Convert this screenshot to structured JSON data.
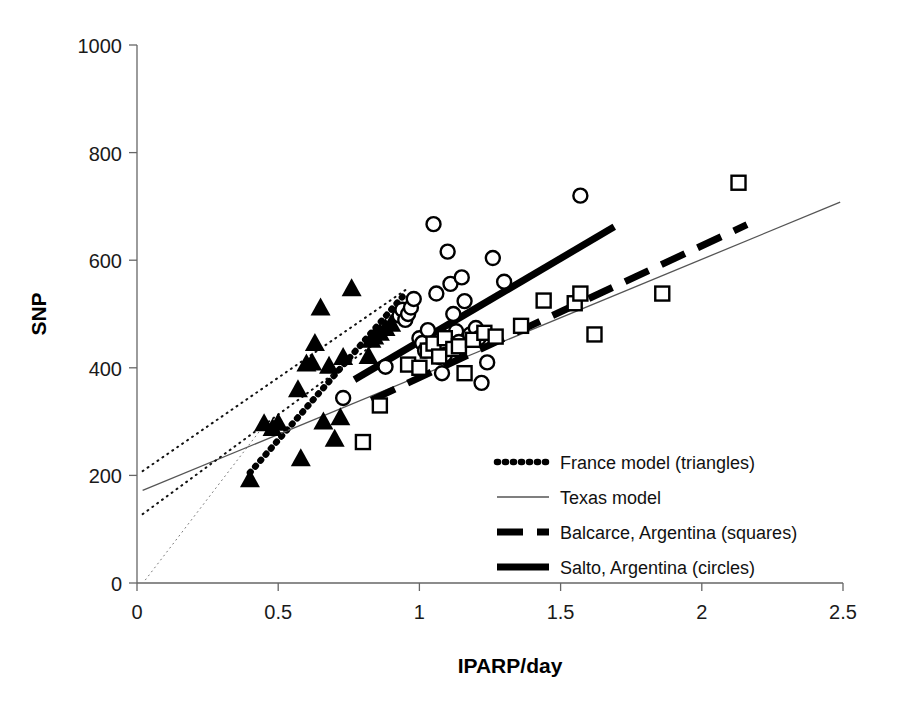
{
  "chart_data": {
    "type": "scatter",
    "title": "",
    "xlabel": "IPARP/day",
    "ylabel": "SNP",
    "xlim": [
      0,
      2.5
    ],
    "ylim": [
      0,
      1000
    ],
    "xticks": [
      "0",
      "0.5",
      "1",
      "1.5",
      "2",
      "2.5"
    ],
    "xtick_values": [
      0,
      0.5,
      1,
      1.5,
      2,
      2.5
    ],
    "yticks": [
      "0",
      "200",
      "400",
      "600",
      "800",
      "1000"
    ],
    "ytick_values": [
      0,
      200,
      400,
      600,
      800,
      1000
    ],
    "grid": false,
    "legend_position": "lower-right-inside",
    "legend": [
      {
        "label": "France model (triangles)",
        "style": "thick-dotted",
        "marker": "filled-triangle"
      },
      {
        "label": "Texas model",
        "style": "thin-solid",
        "marker": "none"
      },
      {
        "label": "Balcarce, Argentina (squares)",
        "style": "thick-dashed",
        "marker": "open-square"
      },
      {
        "label": "Salto, Argentina (circles)",
        "style": "thick-solid",
        "marker": "open-circle"
      }
    ],
    "series": [
      {
        "name": "France model (triangles)",
        "marker": "filled-triangle",
        "points": [
          [
            0.4,
            193
          ],
          [
            0.45,
            297
          ],
          [
            0.48,
            288
          ],
          [
            0.5,
            298
          ],
          [
            0.57,
            360
          ],
          [
            0.58,
            232
          ],
          [
            0.6,
            408
          ],
          [
            0.62,
            410
          ],
          [
            0.63,
            446
          ],
          [
            0.65,
            512
          ],
          [
            0.66,
            300
          ],
          [
            0.68,
            404
          ],
          [
            0.7,
            268
          ],
          [
            0.72,
            308
          ],
          [
            0.73,
            420
          ],
          [
            0.76,
            548
          ],
          [
            0.82,
            422
          ],
          [
            0.83,
            452
          ],
          [
            0.84,
            458
          ],
          [
            0.86,
            465
          ],
          [
            0.88,
            474
          ],
          [
            0.9,
            482
          ]
        ]
      },
      {
        "name": "Salto, Argentina (circles)",
        "marker": "open-circle",
        "points": [
          [
            0.73,
            344
          ],
          [
            0.88,
            402
          ],
          [
            0.93,
            497
          ],
          [
            0.94,
            508
          ],
          [
            0.95,
            489
          ],
          [
            0.96,
            500
          ],
          [
            0.97,
            512
          ],
          [
            0.98,
            528
          ],
          [
            1.0,
            455
          ],
          [
            1.01,
            446
          ],
          [
            1.02,
            432
          ],
          [
            1.03,
            470
          ],
          [
            1.05,
            667
          ],
          [
            1.06,
            538
          ],
          [
            1.07,
            420
          ],
          [
            1.08,
            390
          ],
          [
            1.09,
            424
          ],
          [
            1.1,
            616
          ],
          [
            1.11,
            556
          ],
          [
            1.12,
            500
          ],
          [
            1.13,
            468
          ],
          [
            1.14,
            448
          ],
          [
            1.15,
            568
          ],
          [
            1.16,
            524
          ],
          [
            1.18,
            462
          ],
          [
            1.2,
            474
          ],
          [
            1.21,
            455
          ],
          [
            1.22,
            372
          ],
          [
            1.24,
            410
          ],
          [
            1.26,
            604
          ],
          [
            1.3,
            560
          ],
          [
            1.57,
            720
          ]
        ]
      },
      {
        "name": "Balcarce, Argentina (squares)",
        "marker": "open-square",
        "points": [
          [
            0.8,
            262
          ],
          [
            0.86,
            330
          ],
          [
            0.96,
            406
          ],
          [
            1.0,
            400
          ],
          [
            1.03,
            432
          ],
          [
            1.05,
            445
          ],
          [
            1.07,
            421
          ],
          [
            1.09,
            455
          ],
          [
            1.12,
            435
          ],
          [
            1.14,
            440
          ],
          [
            1.16,
            390
          ],
          [
            1.19,
            452
          ],
          [
            1.23,
            465
          ],
          [
            1.27,
            458
          ],
          [
            1.36,
            478
          ],
          [
            1.44,
            525
          ],
          [
            1.55,
            520
          ],
          [
            1.57,
            538
          ],
          [
            1.62,
            462
          ],
          [
            1.86,
            538
          ],
          [
            2.13,
            744
          ]
        ]
      }
    ],
    "fit_lines": [
      {
        "name": "France model",
        "style": "thick-dotted",
        "x0": 0.4,
        "y0": 205,
        "x1": 0.94,
        "y1": 532
      },
      {
        "name": "Texas model",
        "style": "thin-solid",
        "x0": 0.02,
        "y0": 172,
        "x1": 2.49,
        "y1": 708
      },
      {
        "name": "Balcarce, Argentina",
        "style": "thick-dashed",
        "x0": 0.83,
        "y0": 340,
        "x1": 2.16,
        "y1": 666
      },
      {
        "name": "Salto, Argentina",
        "style": "thick-solid",
        "x0": 0.77,
        "y0": 378,
        "x1": 1.69,
        "y1": 662
      },
      {
        "name": "upper confidence band",
        "style": "thin-dotted",
        "x0": 0.02,
        "y0": 208,
        "x1": 0.96,
        "y1": 548
      },
      {
        "name": "lower confidence band",
        "style": "thin-dotted",
        "x0": 0.02,
        "y0": 128,
        "x1": 0.92,
        "y1": 475
      },
      {
        "name": "origin reference",
        "style": "hairline-dotted",
        "x0": 0.03,
        "y0": 6,
        "x1": 0.46,
        "y1": 300
      }
    ]
  }
}
